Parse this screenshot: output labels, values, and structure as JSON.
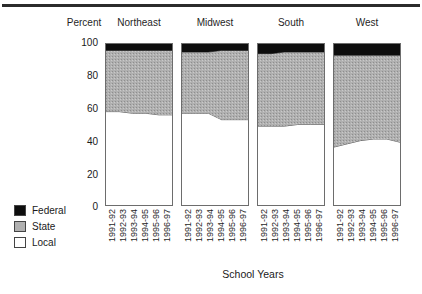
{
  "chart_data": {
    "type": "area",
    "title": "",
    "xlabel": "School Years",
    "ylabel": "Percent",
    "ylim": [
      0,
      100
    ],
    "yticks": [
      100,
      80,
      60,
      40,
      20,
      0
    ],
    "grid": false,
    "legend_position": "bottom-left",
    "categories": [
      "1991-92",
      "1992-93",
      "1993-94",
      "1994-95",
      "1995-96",
      "1996-97"
    ],
    "panels": [
      {
        "name": "Northeast",
        "series": [
          {
            "name": "Local",
            "values": [
              58,
              58,
              57,
              57,
              56,
              56
            ]
          },
          {
            "name": "State",
            "values": [
              38,
              38,
              39,
              39,
              40,
              40
            ]
          },
          {
            "name": "Federal",
            "values": [
              4,
              4,
              4,
              4,
              4,
              4
            ]
          }
        ]
      },
      {
        "name": "Midwest",
        "series": [
          {
            "name": "Local",
            "values": [
              57,
              57,
              57,
              53,
              53,
              53
            ]
          },
          {
            "name": "State",
            "values": [
              38,
              38,
              38,
              43,
              43,
              43
            ]
          },
          {
            "name": "Federal",
            "values": [
              5,
              5,
              5,
              4,
              4,
              4
            ]
          }
        ]
      },
      {
        "name": "South",
        "series": [
          {
            "name": "Local",
            "values": [
              49,
              49,
              49,
              50,
              50,
              50
            ]
          },
          {
            "name": "State",
            "values": [
              45,
              45,
              46,
              45,
              45,
              45
            ]
          },
          {
            "name": "Federal",
            "values": [
              6,
              6,
              5,
              5,
              5,
              5
            ]
          }
        ]
      },
      {
        "name": "West",
        "series": [
          {
            "name": "Local",
            "values": [
              36,
              38,
              40,
              41,
              41,
              39
            ]
          },
          {
            "name": "State",
            "values": [
              57,
              55,
              53,
              52,
              52,
              54
            ]
          },
          {
            "name": "Federal",
            "values": [
              7,
              7,
              7,
              7,
              7,
              7
            ]
          }
        ]
      }
    ],
    "legend": [
      {
        "label": "Federal",
        "color": "#0d0d0d"
      },
      {
        "label": "State",
        "color": "#b0b0b0"
      },
      {
        "label": "Local",
        "color": "#ffffff"
      }
    ],
    "colors": {
      "federal": "#0d0d0d",
      "state": "#b0b0b0",
      "local": "#ffffff",
      "axis": "#6d6d6d",
      "text": "#1f1f1f"
    }
  },
  "header": {
    "percent_label": "Percent",
    "regions": [
      "Northeast",
      "Midwest",
      "South",
      "West"
    ]
  },
  "yaxis": {
    "ticks": [
      "100",
      "80",
      "60",
      "40",
      "20",
      "0"
    ]
  },
  "xaxis": {
    "title": "School Years",
    "ticks": [
      "1991-92",
      "1992-93",
      "1993-94",
      "1994-95",
      "1995-96",
      "1996-97"
    ]
  },
  "legend": {
    "items": [
      {
        "label": "Federal"
      },
      {
        "label": "State"
      },
      {
        "label": "Local"
      }
    ]
  }
}
